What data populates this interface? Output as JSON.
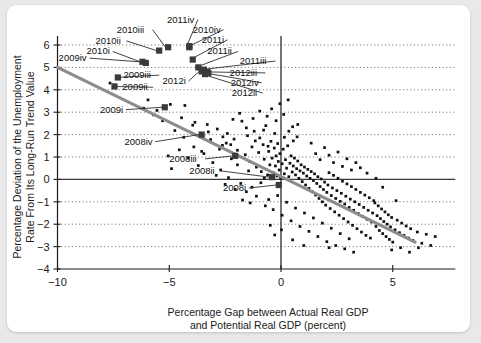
{
  "card": {
    "background": "#ffffff",
    "page_background": "#e9e9e9"
  },
  "chart_data": {
    "type": "scatter",
    "title": "",
    "xlabel_line1": "Percentage Gap between Actual Real GDP",
    "xlabel_line2": "and Potential Real GDP (percent)",
    "ylabel_line1": "Percentage Deviation of the Unemployment",
    "ylabel_line2": "Rate From Its Long-Run Trend Value",
    "xlim": [
      -10.8,
      7.8
    ],
    "ylim": [
      -4,
      6.4
    ],
    "xticks": [
      -10,
      -5,
      0,
      5
    ],
    "xtick_labels": [
      "−10",
      "−5",
      "0",
      "5"
    ],
    "yticks": [
      -4,
      -3,
      -2,
      -1,
      0,
      1,
      2,
      3,
      4,
      5,
      6
    ],
    "ytick_labels": [
      "−4",
      "−3",
      "−2",
      "−1",
      "0",
      "1",
      "2",
      "3",
      "4",
      "5",
      "6"
    ],
    "grid": "horizontal-dotted",
    "legend": "none",
    "marker_color": "#111111",
    "highlight_color": "#3a3a3a",
    "trendline_color": "#8c8c8c",
    "trendline": {
      "x1": -10.0,
      "y1": 5.0,
      "x2": 6.0,
      "y2": -2.8
    },
    "highlighted_points": [
      {
        "label": "2009iv",
        "x": -6.2,
        "y": 5.25,
        "lx": -9.95,
        "ly": 5.28,
        "anchor": "start"
      },
      {
        "label": "2010i",
        "x": -6.05,
        "y": 5.2,
        "lx": -8.7,
        "ly": 5.58,
        "anchor": "start"
      },
      {
        "label": "2010ii",
        "x": -5.45,
        "y": 5.75,
        "lx": -8.3,
        "ly": 6.05,
        "anchor": "start"
      },
      {
        "label": "2010iii",
        "x": -5.05,
        "y": 5.9,
        "lx": -7.35,
        "ly": 6.55,
        "anchor": "start"
      },
      {
        "label": "2011iv",
        "x": -4.1,
        "y": 5.95,
        "lx": -5.1,
        "ly": 7.0,
        "anchor": "start"
      },
      {
        "label": "2010iv",
        "x": -4.1,
        "y": 5.9,
        "lx": -3.95,
        "ly": 6.55,
        "anchor": "start"
      },
      {
        "label": "2011i",
        "x": -3.95,
        "y": 5.35,
        "lx": -3.55,
        "ly": 6.1,
        "anchor": "start"
      },
      {
        "label": "2011ii",
        "x": -3.7,
        "y": 5.0,
        "lx": -3.3,
        "ly": 5.58,
        "anchor": "start"
      },
      {
        "label": "2011iii",
        "x": -3.45,
        "y": 4.9,
        "lx": -1.85,
        "ly": 5.15,
        "anchor": "start"
      },
      {
        "label": "2012i",
        "x": -3.55,
        "y": 4.82,
        "lx": -5.3,
        "ly": 4.25,
        "anchor": "start"
      },
      {
        "label": "2012iii",
        "x": -3.3,
        "y": 4.8,
        "lx": -2.3,
        "ly": 4.62,
        "anchor": "start"
      },
      {
        "label": "2012iv",
        "x": -3.25,
        "y": 4.75,
        "lx": -2.25,
        "ly": 4.18,
        "anchor": "start"
      },
      {
        "label": "2012ii",
        "x": -3.4,
        "y": 4.7,
        "lx": -2.2,
        "ly": 3.72,
        "anchor": "start"
      },
      {
        "label": "2009iii",
        "x": -7.3,
        "y": 4.55,
        "lx": -7.05,
        "ly": 4.52,
        "anchor": "start"
      },
      {
        "label": "2009ii",
        "x": -7.45,
        "y": 4.15,
        "lx": -7.1,
        "ly": 3.98,
        "anchor": "start"
      },
      {
        "label": "2009i",
        "x": -5.2,
        "y": 3.22,
        "lx": -8.1,
        "ly": 2.98,
        "anchor": "start"
      },
      {
        "label": "2008iv",
        "x": -3.55,
        "y": 2.0,
        "lx": -7.0,
        "ly": 1.55,
        "anchor": "start"
      },
      {
        "label": "2008iii",
        "x": -2.05,
        "y": 1.05,
        "lx": -5.0,
        "ly": 0.78,
        "anchor": "start"
      },
      {
        "label": "2008ii",
        "x": -0.4,
        "y": 0.1,
        "lx": -4.1,
        "ly": 0.25,
        "anchor": "start"
      },
      {
        "label": "2008i",
        "x": -0.1,
        "y": -0.25,
        "lx": -2.6,
        "ly": -0.52,
        "anchor": "start"
      }
    ],
    "scatter_points": [
      [
        -7.65,
        4.3
      ],
      [
        -5.95,
        3.55
      ],
      [
        -4.95,
        3.35
      ],
      [
        -4.3,
        3.3
      ],
      [
        -3.85,
        2.55
      ],
      [
        -3.3,
        2.45
      ],
      [
        -2.85,
        2.25
      ],
      [
        -2.6,
        1.9
      ],
      [
        -2.4,
        2.05
      ],
      [
        -2.25,
        1.55
      ],
      [
        -2.1,
        1.8
      ],
      [
        -1.95,
        1.3
      ],
      [
        -1.75,
        2.6
      ],
      [
        -1.6,
        1.1
      ],
      [
        -1.5,
        1.95
      ],
      [
        -1.4,
        0.8
      ],
      [
        -1.3,
        1.45
      ],
      [
        -1.2,
        2.15
      ],
      [
        -1.1,
        0.55
      ],
      [
        -1.0,
        1.2
      ],
      [
        -0.95,
        1.85
      ],
      [
        -0.88,
        0.35
      ],
      [
        -0.8,
        1.55
      ],
      [
        -0.75,
        0.9
      ],
      [
        -0.68,
        2.4
      ],
      [
        -0.6,
        0.2
      ],
      [
        -0.55,
        1.25
      ],
      [
        -0.5,
        0.65
      ],
      [
        -0.45,
        1.7
      ],
      [
        -0.4,
        0.95
      ],
      [
        -0.35,
        0.3
      ],
      [
        -0.3,
        1.4
      ],
      [
        -0.28,
        2.05
      ],
      [
        -0.25,
        0.6
      ],
      [
        -0.22,
        1.05
      ],
      [
        -0.18,
        0.15
      ],
      [
        -0.15,
        1.6
      ],
      [
        -0.12,
        0.8
      ],
      [
        -0.08,
        0.42
      ],
      [
        -0.05,
        1.15
      ],
      [
        -0.02,
        0.05
      ],
      [
        0.05,
        0.7
      ],
      [
        0.1,
        1.35
      ],
      [
        0.15,
        0.25
      ],
      [
        0.2,
        0.88
      ],
      [
        0.25,
        0.5
      ],
      [
        0.3,
        1.5
      ],
      [
        0.35,
        0.12
      ],
      [
        0.4,
        0.72
      ],
      [
        0.45,
        1.05
      ],
      [
        0.5,
        0.33
      ],
      [
        0.55,
        0.6
      ],
      [
        0.6,
        0.95
      ],
      [
        0.65,
        0.2
      ],
      [
        0.7,
        0.48
      ],
      [
        0.75,
        0.82
      ],
      [
        0.8,
        0.05
      ],
      [
        0.85,
        0.38
      ],
      [
        0.9,
        0.65
      ],
      [
        0.95,
        -0.1
      ],
      [
        1.0,
        0.28
      ],
      [
        1.05,
        0.55
      ],
      [
        1.1,
        -0.25
      ],
      [
        1.15,
        0.15
      ],
      [
        1.2,
        0.45
      ],
      [
        1.25,
        -0.4
      ],
      [
        1.3,
        0.05
      ],
      [
        1.35,
        0.35
      ],
      [
        1.4,
        -0.55
      ],
      [
        1.45,
        -0.05
      ],
      [
        1.5,
        0.25
      ],
      [
        1.55,
        -0.7
      ],
      [
        1.6,
        -0.18
      ],
      [
        1.65,
        0.12
      ],
      [
        1.7,
        -0.85
      ],
      [
        1.75,
        -0.32
      ],
      [
        1.8,
        0.02
      ],
      [
        1.85,
        -1.0
      ],
      [
        1.9,
        -0.45
      ],
      [
        1.95,
        -0.12
      ],
      [
        2.0,
        -1.15
      ],
      [
        2.05,
        -0.58
      ],
      [
        2.1,
        -0.25
      ],
      [
        2.15,
        0.3
      ],
      [
        2.2,
        -1.3
      ],
      [
        2.25,
        -0.72
      ],
      [
        2.3,
        -0.38
      ],
      [
        2.35,
        0.18
      ],
      [
        2.4,
        -1.45
      ],
      [
        2.45,
        -0.85
      ],
      [
        2.5,
        -0.5
      ],
      [
        2.55,
        0.05
      ],
      [
        2.6,
        -1.6
      ],
      [
        2.65,
        -0.98
      ],
      [
        2.7,
        -0.62
      ],
      [
        2.75,
        -0.08
      ],
      [
        2.8,
        -1.75
      ],
      [
        2.85,
        -1.1
      ],
      [
        2.9,
        -0.75
      ],
      [
        2.95,
        -0.2
      ],
      [
        3.0,
        -1.9
      ],
      [
        3.05,
        -1.25
      ],
      [
        3.1,
        -0.88
      ],
      [
        3.15,
        -0.32
      ],
      [
        3.2,
        -2.05
      ],
      [
        3.25,
        -1.38
      ],
      [
        3.3,
        -1.0
      ],
      [
        3.35,
        -0.45
      ],
      [
        3.4,
        -2.2
      ],
      [
        3.45,
        -1.52
      ],
      [
        3.5,
        -1.12
      ],
      [
        3.55,
        -0.58
      ],
      [
        3.6,
        -2.35
      ],
      [
        3.65,
        -1.65
      ],
      [
        3.7,
        -1.25
      ],
      [
        3.75,
        -0.7
      ],
      [
        3.8,
        -2.5
      ],
      [
        3.85,
        -1.78
      ],
      [
        3.9,
        -1.38
      ],
      [
        3.95,
        -0.82
      ],
      [
        4.0,
        -2.62
      ],
      [
        4.05,
        -1.9
      ],
      [
        4.1,
        -1.5
      ],
      [
        4.15,
        -0.95
      ],
      [
        4.2,
        -1.05
      ],
      [
        4.25,
        -2.1
      ],
      [
        4.3,
        -1.62
      ],
      [
        4.35,
        -1.18
      ],
      [
        4.4,
        -2.28
      ],
      [
        4.45,
        -1.75
      ],
      [
        4.5,
        -1.32
      ],
      [
        4.55,
        -2.42
      ],
      [
        4.6,
        -1.88
      ],
      [
        4.65,
        -1.45
      ],
      [
        4.7,
        -2.55
      ],
      [
        4.75,
        -2.0
      ],
      [
        4.8,
        -1.58
      ],
      [
        4.85,
        -2.68
      ],
      [
        4.9,
        -2.12
      ],
      [
        4.95,
        -1.7
      ],
      [
        5.0,
        -2.8
      ],
      [
        5.1,
        -2.25
      ],
      [
        5.2,
        -1.82
      ],
      [
        5.3,
        -2.38
      ],
      [
        5.4,
        -1.95
      ],
      [
        5.5,
        -2.5
      ],
      [
        5.6,
        -2.08
      ],
      [
        5.7,
        -2.62
      ],
      [
        5.8,
        -2.2
      ],
      [
        5.9,
        -2.72
      ],
      [
        6.1,
        -2.35
      ],
      [
        6.3,
        -2.85
      ],
      [
        6.5,
        -2.45
      ],
      [
        6.7,
        -2.95
      ],
      [
        6.9,
        -2.55
      ],
      [
        -0.55,
        -0.9
      ],
      [
        -0.35,
        -1.35
      ],
      [
        -0.15,
        -0.72
      ],
      [
        0.05,
        -1.6
      ],
      [
        0.25,
        -1.02
      ],
      [
        0.45,
        -1.85
      ],
      [
        0.65,
        -1.28
      ],
      [
        0.85,
        -2.1
      ],
      [
        1.05,
        -1.5
      ],
      [
        1.25,
        -2.32
      ],
      [
        1.45,
        -1.72
      ],
      [
        1.65,
        -2.55
      ],
      [
        1.85,
        -1.95
      ],
      [
        2.05,
        -2.78
      ],
      [
        2.25,
        -2.18
      ],
      [
        2.45,
        -2.95
      ],
      [
        2.65,
        -2.42
      ],
      [
        2.85,
        -3.1
      ],
      [
        3.05,
        -2.65
      ],
      [
        3.25,
        -3.25
      ],
      [
        -1.3,
        -0.35
      ],
      [
        -1.1,
        -0.75
      ],
      [
        -0.9,
        -0.15
      ],
      [
        -0.7,
        -1.18
      ],
      [
        -1.55,
        -0.55
      ],
      [
        -1.8,
        -0.18
      ],
      [
        -2.05,
        -0.45
      ],
      [
        -2.35,
        0.08
      ],
      [
        -2.7,
        0.42
      ],
      [
        -3.05,
        0.75
      ],
      [
        -3.45,
        1.15
      ],
      [
        -3.9,
        1.45
      ],
      [
        -4.35,
        1.88
      ],
      [
        -4.75,
        2.18
      ],
      [
        -5.3,
        2.62
      ],
      [
        -5.7,
        2.88
      ],
      [
        -6.15,
        3.18
      ],
      [
        -2.5,
        -0.22
      ],
      [
        -2.9,
        0.18
      ],
      [
        -1.95,
        0.65
      ],
      [
        -1.45,
        0.38
      ],
      [
        -1.15,
        1.72
      ],
      [
        -0.62,
        2.82
      ],
      [
        -0.42,
        3.15
      ],
      [
        -0.22,
        2.62
      ],
      [
        -0.05,
        3.38
      ],
      [
        0.12,
        2.9
      ],
      [
        0.32,
        3.55
      ],
      [
        0.52,
        2.35
      ],
      [
        0.72,
        1.9
      ],
      [
        -0.95,
        3.05
      ],
      [
        -0.78,
        2.2
      ],
      [
        -1.25,
        2.72
      ],
      [
        -1.55,
        2.3
      ],
      [
        -1.85,
        2.95
      ],
      [
        -2.15,
        2.68
      ],
      [
        -2.45,
        1.62
      ],
      [
        -2.75,
        1.35
      ],
      [
        -3.15,
        1.78
      ],
      [
        -3.55,
        1.25
      ],
      [
        4.25,
        0.05
      ],
      [
        4.55,
        -0.35
      ],
      [
        3.85,
        0.28
      ],
      [
        3.55,
        0.52
      ],
      [
        5.15,
        -0.95
      ],
      [
        1.35,
        1.62
      ],
      [
        1.55,
        1.15
      ],
      [
        1.75,
        0.88
      ],
      [
        1.95,
        1.42
      ],
      [
        2.15,
        1.08
      ],
      [
        2.35,
        0.75
      ],
      [
        2.55,
        1.22
      ],
      [
        2.75,
        0.58
      ],
      [
        2.95,
        0.92
      ],
      [
        3.15,
        0.42
      ],
      [
        3.35,
        0.75
      ],
      [
        0.15,
        1.88
      ],
      [
        0.35,
        2.15
      ],
      [
        0.55,
        1.72
      ],
      [
        0.75,
        2.45
      ],
      [
        -4.15,
        0.95
      ],
      [
        -4.55,
        1.32
      ],
      [
        -5.05,
        1.05
      ],
      [
        -3.7,
        0.62
      ],
      [
        -4.9,
        0.48
      ],
      [
        -0.48,
        -2.05
      ],
      [
        -0.28,
        -2.48
      ],
      [
        0.02,
        -2.25
      ],
      [
        0.52,
        -2.7
      ],
      [
        1.02,
        -2.95
      ],
      [
        5.35,
        -3.05
      ],
      [
        5.75,
        -3.25
      ],
      [
        4.95,
        -3.15
      ],
      [
        6.15,
        -3.05
      ],
      [
        2.15,
        -3.05
      ],
      [
        -0.75,
        0.05
      ],
      [
        -0.58,
        1.48
      ],
      [
        -1.38,
        -1.05
      ],
      [
        -1.72,
        -0.92
      ],
      [
        -2.22,
        0.92
      ],
      [
        -2.62,
        1.52
      ],
      [
        -3.25,
        2.12
      ],
      [
        -3.95,
        2.42
      ],
      [
        -4.45,
        2.75
      ],
      [
        -5.55,
        3.08
      ]
    ]
  }
}
